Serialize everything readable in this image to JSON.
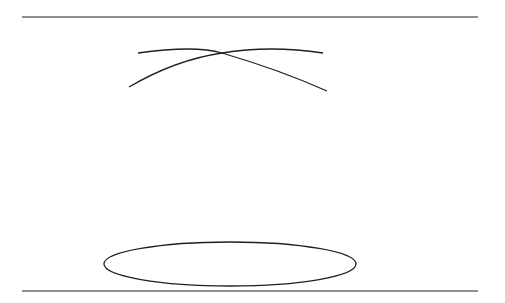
{
  "diagram": {
    "ovals": {
      "consent": "Consent",
      "transparency": "Transparency",
      "technology": "Technology",
      "law": "Law and Regulations",
      "base": "Fair Information Practices"
    },
    "pyramid": {
      "bottom_tier": "Trust",
      "side_labels": [
        "Policy",
        "Governance",
        "Sanctions"
      ]
    }
  },
  "colors": {
    "stroke": "#231f20",
    "background": "#ffffff"
  }
}
